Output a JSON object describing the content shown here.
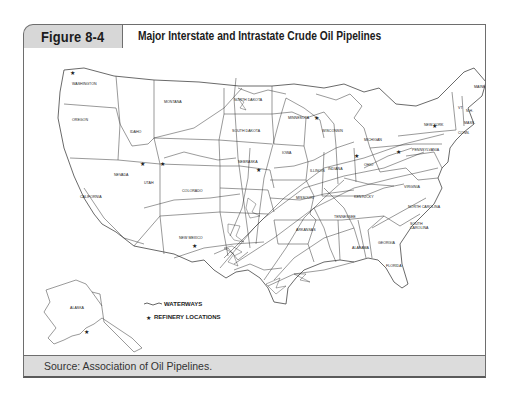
{
  "figure": {
    "number_label": "Figure 8-4",
    "title": "Major Interstate and Intrastate Crude Oil Pipelines",
    "source": "Source: Association of Oil Pipelines."
  },
  "map": {
    "legend": {
      "waterways_label": "WATERWAYS",
      "refinery_label": "REFINERY LOCATIONS",
      "waterways_icon": "wavy-line-icon",
      "refinery_icon": "star-icon"
    },
    "state_labels": [
      {
        "name": "WASHINGTON",
        "x": 62,
        "y": 37
      },
      {
        "name": "OREGON",
        "x": 55,
        "y": 73
      },
      {
        "name": "IDAHO",
        "x": 111,
        "y": 85
      },
      {
        "name": "MONTANA",
        "x": 146,
        "y": 55
      },
      {
        "name": "NORTH DAKOTA",
        "x": 220,
        "y": 53
      },
      {
        "name": "SOUTH DAKOTA",
        "x": 218,
        "y": 84
      },
      {
        "name": "MINNESOTA",
        "x": 271,
        "y": 71
      },
      {
        "name": "WISCONSIN",
        "x": 306,
        "y": 84
      },
      {
        "name": "MICHIGAN",
        "x": 346,
        "y": 93
      },
      {
        "name": "NEW YORK",
        "x": 408,
        "y": 78
      },
      {
        "name": "VT",
        "x": 437,
        "y": 61
      },
      {
        "name": "N.H.",
        "x": 446,
        "y": 64
      },
      {
        "name": "MAINE",
        "x": 455,
        "y": 40
      },
      {
        "name": "MASS.",
        "x": 445,
        "y": 76
      },
      {
        "name": "CONN.",
        "x": 440,
        "y": 86
      },
      {
        "name": "PENNSYLVANIA",
        "x": 400,
        "y": 103
      },
      {
        "name": "IOWA",
        "x": 263,
        "y": 106
      },
      {
        "name": "NEBRASKA",
        "x": 221,
        "y": 115
      },
      {
        "name": "NEVADA",
        "x": 96,
        "y": 128
      },
      {
        "name": "UTAH",
        "x": 124,
        "y": 136
      },
      {
        "name": "COLORADO",
        "x": 166,
        "y": 144
      },
      {
        "name": "CALIFORNIA",
        "x": 65,
        "y": 150
      },
      {
        "name": "ILLINOIS",
        "x": 291,
        "y": 124
      },
      {
        "name": "INDIANA",
        "x": 309,
        "y": 122
      },
      {
        "name": "OHIO",
        "x": 344,
        "y": 118
      },
      {
        "name": "MISSOURI",
        "x": 278,
        "y": 151
      },
      {
        "name": "KENTUCKY",
        "x": 336,
        "y": 150
      },
      {
        "name": "VIRGINIA",
        "x": 385,
        "y": 140
      },
      {
        "name": "KANSAS",
        "x": 232,
        "y": 150
      },
      {
        "name": "NORTH CAROLINA",
        "x": 393,
        "y": 160
      },
      {
        "name": "TENNESSEE",
        "x": 318,
        "y": 170
      },
      {
        "name": "SOUTH CAROLINA",
        "x": 393,
        "y": 177
      },
      {
        "name": "NEW MEXICO",
        "x": 164,
        "y": 191
      },
      {
        "name": "ARKANSAS",
        "x": 278,
        "y": 183
      },
      {
        "name": "GEORGIA",
        "x": 360,
        "y": 196
      },
      {
        "name": "ALABAMA",
        "x": 334,
        "y": 201
      },
      {
        "name": "FLORIDA",
        "x": 368,
        "y": 219
      },
      {
        "name": "ALASKA",
        "x": 50,
        "y": 261
      }
    ],
    "refinery_count_visible": "many"
  }
}
